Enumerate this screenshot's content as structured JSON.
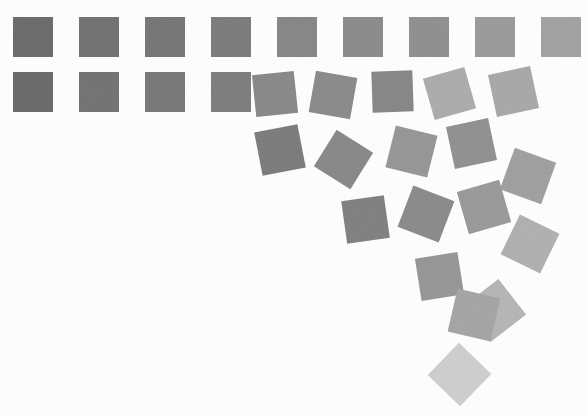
{
  "artwork": {
    "title": "Disorder Grid",
    "description": "Generative composition of square tiles whose rotation, displacement and lightness increase with distance from the upper-left origin.",
    "background_color": "#fefefe",
    "canvas": {
      "width": 587,
      "height": 417
    },
    "tile_size": 40,
    "column_pitch": 66,
    "row_pitch": 55
  },
  "chart_data": {
    "type": "scatter",
    "subtitle": "",
    "xlabel": "",
    "ylabel": "",
    "xlim": [
      0,
      587
    ],
    "ylim": [
      0,
      417
    ],
    "grid": false,
    "legend": "none",
    "marker": "square",
    "series": [
      {
        "name": "tiles",
        "point_count": 26,
        "fields": [
          "x",
          "y",
          "size",
          "rotation_deg",
          "fill"
        ],
        "points": [
          {
            "x": 13,
            "y": 17,
            "size": 40,
            "rotation_deg": 0,
            "fill": "#6f6f6f",
            "row": 1,
            "col": 1
          },
          {
            "x": 79,
            "y": 17,
            "size": 40,
            "rotation_deg": 0,
            "fill": "#757575",
            "row": 1,
            "col": 2
          },
          {
            "x": 145,
            "y": 17,
            "size": 40,
            "rotation_deg": 0,
            "fill": "#797979",
            "row": 1,
            "col": 3
          },
          {
            "x": 211,
            "y": 17,
            "size": 40,
            "rotation_deg": 0,
            "fill": "#7f7f7f",
            "row": 1,
            "col": 4
          },
          {
            "x": 277,
            "y": 17,
            "size": 40,
            "rotation_deg": 0,
            "fill": "#8a8a8a",
            "row": 1,
            "col": 5
          },
          {
            "x": 343,
            "y": 17,
            "size": 40,
            "rotation_deg": 0,
            "fill": "#8f8f8f",
            "row": 1,
            "col": 6
          },
          {
            "x": 409,
            "y": 17,
            "size": 40,
            "rotation_deg": 0,
            "fill": "#939393",
            "row": 1,
            "col": 7
          },
          {
            "x": 475,
            "y": 17,
            "size": 40,
            "rotation_deg": 0,
            "fill": "#9e9e9e",
            "row": 1,
            "col": 8
          },
          {
            "x": 541,
            "y": 17,
            "size": 40,
            "rotation_deg": 0,
            "fill": "#a5a5a5",
            "row": 1,
            "col": 9
          },
          {
            "x": 13,
            "y": 72,
            "size": 40,
            "rotation_deg": 0,
            "fill": "#6e6e6e",
            "row": 2,
            "col": 1
          },
          {
            "x": 79,
            "y": 72,
            "size": 40,
            "rotation_deg": 0,
            "fill": "#767676",
            "row": 2,
            "col": 2
          },
          {
            "x": 145,
            "y": 72,
            "size": 40,
            "rotation_deg": 0,
            "fill": "#7b7b7b",
            "row": 2,
            "col": 3
          },
          {
            "x": 211,
            "y": 72,
            "size": 40,
            "rotation_deg": 0,
            "fill": "#818181",
            "row": 2,
            "col": 4
          },
          {
            "x": 254,
            "y": 73,
            "size": 42,
            "rotation_deg": -6,
            "fill": "#8c8c8c",
            "row": 2,
            "col": 5
          },
          {
            "x": 312,
            "y": 74,
            "size": 42,
            "rotation_deg": 10,
            "fill": "#8e8e8e",
            "row": 2,
            "col": 6
          },
          {
            "x": 372,
            "y": 71,
            "size": 41,
            "rotation_deg": -2,
            "fill": "#8a8a8a",
            "row": 2,
            "col": 7
          },
          {
            "x": 428,
            "y": 72,
            "size": 43,
            "rotation_deg": -16,
            "fill": "#b0b0b0",
            "row": 2,
            "col": 8
          },
          {
            "x": 492,
            "y": 70,
            "size": 43,
            "rotation_deg": -12,
            "fill": "#acacac",
            "row": 2,
            "col": 9
          },
          {
            "x": 258,
            "y": 128,
            "size": 44,
            "rotation_deg": -11,
            "fill": "#7f7f7f",
            "row": 3,
            "col": 5
          },
          {
            "x": 322,
            "y": 138,
            "size": 43,
            "rotation_deg": 32,
            "fill": "#8c8c8c",
            "row": 3,
            "col": 6
          },
          {
            "x": 390,
            "y": 130,
            "size": 43,
            "rotation_deg": 14,
            "fill": "#9a9a9a",
            "row": 3,
            "col": 7
          },
          {
            "x": 450,
            "y": 122,
            "size": 43,
            "rotation_deg": -12,
            "fill": "#949494",
            "row": 3,
            "col": 8
          },
          {
            "x": 506,
            "y": 154,
            "size": 44,
            "rotation_deg": 20,
            "fill": "#a3a3a3",
            "row": 3,
            "col": 9
          },
          {
            "x": 344,
            "y": 198,
            "size": 43,
            "rotation_deg": -8,
            "fill": "#848484",
            "row": 4,
            "col": 6
          },
          {
            "x": 404,
            "y": 192,
            "size": 44,
            "rotation_deg": 21,
            "fill": "#8e8e8e",
            "row": 4,
            "col": 7
          },
          {
            "x": 462,
            "y": 185,
            "size": 44,
            "rotation_deg": -16,
            "fill": "#9d9d9d",
            "row": 4,
            "col": 8
          },
          {
            "x": 508,
            "y": 222,
            "size": 44,
            "rotation_deg": 26,
            "fill": "#b4b4b4",
            "row": 4,
            "col": 9
          },
          {
            "x": 418,
            "y": 255,
            "size": 43,
            "rotation_deg": -9,
            "fill": "#9a9a9a",
            "row": 5,
            "col": 7
          },
          {
            "x": 472,
            "y": 288,
            "size": 45,
            "rotation_deg": -38,
            "fill": "#b9b9b9",
            "row": 5,
            "col": 8
          },
          {
            "x": 452,
            "y": 293,
            "size": 44,
            "rotation_deg": 13,
            "fill": "#a8a8a8",
            "row": 6,
            "col": 7
          },
          {
            "x": 437,
            "y": 352,
            "size": 45,
            "rotation_deg": 44,
            "fill": "#d2d2d2",
            "row": 7,
            "col": 7
          }
        ]
      }
    ]
  }
}
